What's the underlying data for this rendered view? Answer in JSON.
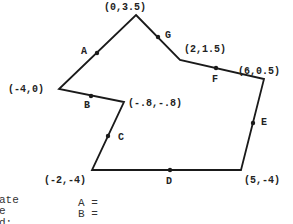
{
  "diagram": {
    "type": "polygon",
    "stroke_color": "#1a1a1a",
    "vertices": [
      {
        "label": "(0,3.5)",
        "px": [
          136,
          15
        ],
        "label_pos": [
          104,
          10
        ]
      },
      {
        "label": "(2,1.5)",
        "px": [
          180,
          60
        ],
        "label_pos": [
          184,
          52
        ]
      },
      {
        "label": "(6,0.5)",
        "px": [
          264,
          79
        ],
        "label_pos": [
          248,
          74
        ]
      },
      {
        "label": "(5,-4)",
        "px": [
          241,
          170
        ],
        "label_pos": [
          244,
          183
        ]
      },
      {
        "label": "(-2,-4)",
        "px": [
          92,
          170
        ],
        "label_pos": [
          44,
          183
        ]
      },
      {
        "label": "(-.8,-.8)",
        "px": [
          124,
          102
        ],
        "label_pos": [
          128,
          106
        ]
      },
      {
        "label": "(-4,0)",
        "px": [
          59,
          89
        ],
        "label_pos": [
          8,
          92
        ]
      }
    ],
    "midpoints": [
      {
        "label": "A",
        "px": [
          97,
          53
        ],
        "label_pos": [
          81,
          54
        ]
      },
      {
        "label": "B",
        "px": [
          91,
          96
        ],
        "label_pos": [
          84,
          108
        ]
      },
      {
        "label": "C",
        "px": [
          108,
          136
        ],
        "label_pos": [
          119,
          139
        ]
      },
      {
        "label": "D",
        "px": [
          170,
          170
        ],
        "label_pos": [
          166,
          183
        ]
      },
      {
        "label": "E",
        "px": [
          253,
          123
        ],
        "label_pos": [
          262,
          123
        ]
      },
      {
        "label": "F",
        "px": [
          216,
          68
        ],
        "label_pos": [
          213,
          81
        ]
      },
      {
        "label": "G",
        "px": [
          158,
          37
        ],
        "label_pos": [
          166,
          37
        ]
      }
    ]
  },
  "notes": {
    "left_lines": [
      "ate",
      "e",
      "d:"
    ],
    "answer_lines": [
      "A =",
      "B ="
    ]
  }
}
